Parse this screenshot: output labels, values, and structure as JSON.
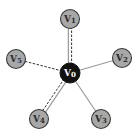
{
  "diagram": {
    "type": "star-graph",
    "colors": {
      "background": "#ffffff",
      "outer_node_fill": "#a8a8a8",
      "outer_node_stroke": "#3a3a3a",
      "center_node_fill": "#111111",
      "center_node_text": "#ffffff",
      "outer_node_text": "#2a2a2a",
      "solid_edge": "#9a9a9a",
      "dashed_edge": "#333333"
    },
    "nodes": [
      {
        "id": "v0",
        "label": "V0",
        "x": 70,
        "y": 73,
        "r": 10,
        "role": "center"
      },
      {
        "id": "v1",
        "label": "V1",
        "x": 70,
        "y": 19,
        "r": 9.5,
        "role": "outer"
      },
      {
        "id": "v2",
        "label": "V2",
        "x": 122,
        "y": 58,
        "r": 9.5,
        "role": "outer"
      },
      {
        "id": "v3",
        "label": "V3",
        "x": 101,
        "y": 119,
        "r": 9.5,
        "role": "outer"
      },
      {
        "id": "v4",
        "label": "V4",
        "x": 39,
        "y": 119,
        "r": 9.5,
        "role": "outer"
      },
      {
        "id": "v5",
        "label": "V5",
        "x": 16,
        "y": 59,
        "r": 9.5,
        "role": "outer"
      }
    ],
    "edges": [
      {
        "from": "v0",
        "to": "v1",
        "style": "double",
        "lines": [
          "solid",
          "dashed"
        ]
      },
      {
        "from": "v0",
        "to": "v2",
        "style": "single",
        "lines": [
          "solid"
        ]
      },
      {
        "from": "v0",
        "to": "v3",
        "style": "single",
        "lines": [
          "solid"
        ]
      },
      {
        "from": "v0",
        "to": "v4",
        "style": "double",
        "lines": [
          "solid",
          "dashed"
        ]
      },
      {
        "from": "v0",
        "to": "v5",
        "style": "single",
        "lines": [
          "dashed"
        ]
      }
    ]
  }
}
